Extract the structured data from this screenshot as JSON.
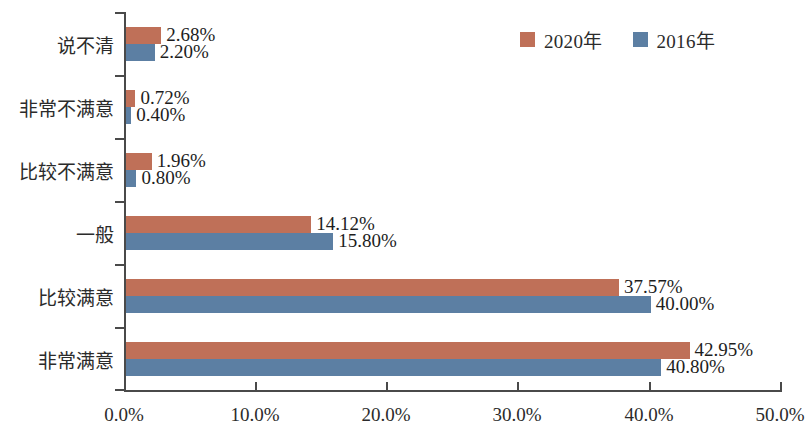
{
  "chart_data": {
    "type": "bar",
    "orientation": "horizontal",
    "title": "",
    "subtitle": "",
    "xlabel": "",
    "ylabel": "",
    "xlim": [
      0,
      50
    ],
    "xticks": [
      "0.0%",
      "10.0%",
      "20.0%",
      "30.0%",
      "40.0%",
      "50.0%"
    ],
    "xtick_values": [
      0,
      10,
      20,
      30,
      40,
      50
    ],
    "grid": false,
    "legend_position": "top-right",
    "categories": [
      "非常满意",
      "比较满意",
      "一般",
      "比较不满意",
      "非常不满意",
      "说不清"
    ],
    "series": [
      {
        "name": "2020年",
        "color": "#bf7058",
        "values": [
          42.95,
          37.57,
          14.12,
          1.96,
          0.72,
          2.68
        ],
        "labels": [
          "42.95%",
          "37.57%",
          "14.12%",
          "1.96%",
          "0.72%",
          "2.68%"
        ]
      },
      {
        "name": "2016年",
        "color": "#5c7fa3",
        "values": [
          40.8,
          40.0,
          15.8,
          0.8,
          0.4,
          2.2
        ],
        "labels": [
          "40.80%",
          "40.00%",
          "15.80%",
          "0.80%",
          "0.40%",
          "2.20%"
        ]
      }
    ]
  },
  "legend": {
    "entries": [
      {
        "label": "2020年",
        "color": "#bf7058"
      },
      {
        "label": "2016年",
        "color": "#5c7fa3"
      }
    ]
  },
  "axis": {
    "line_color": "#4a4a4a"
  }
}
